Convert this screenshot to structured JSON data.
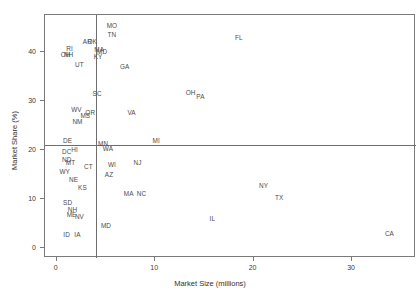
{
  "chart_data": {
    "type": "scatter",
    "title": "",
    "xlabel": "Market Size (millions)",
    "ylabel": "Market Share (%)",
    "xlim": [
      -1.2,
      36.5
    ],
    "ylim": [
      -2.0,
      47.5
    ],
    "xticks": [
      0,
      10,
      20,
      30
    ],
    "yticks": [
      0,
      10,
      20,
      30,
      40
    ],
    "grid": false,
    "legend": null,
    "point_style": "text-label-only",
    "reference_lines": [
      {
        "orientation": "vertical",
        "x": 4.0
      },
      {
        "orientation": "horizontal",
        "y": 21.0
      }
    ],
    "points": [
      {
        "label": "MO",
        "x": 5.6,
        "y": 45.3
      },
      {
        "label": "TN",
        "x": 5.6,
        "y": 43.4
      },
      {
        "label": "AR",
        "x": 3.1,
        "y": 42.1
      },
      {
        "label": "OK",
        "x": 3.6,
        "y": 42.1
      },
      {
        "label": "RI",
        "x": 1.3,
        "y": 40.6
      },
      {
        "label": "MA",
        "x": 4.3,
        "y": 40.4
      },
      {
        "label": "MD",
        "x": 4.6,
        "y": 40.0
      },
      {
        "label": "OH",
        "x": 0.9,
        "y": 39.4
      },
      {
        "label": "NH",
        "x": 1.2,
        "y": 39.4
      },
      {
        "label": "KY",
        "x": 4.2,
        "y": 39.0
      },
      {
        "label": "UT",
        "x": 2.3,
        "y": 37.3
      },
      {
        "label": "GA",
        "x": 6.9,
        "y": 37.0
      },
      {
        "label": "FL",
        "x": 18.5,
        "y": 42.8
      },
      {
        "label": "OH2",
        "x": 13.6,
        "y": 31.6
      },
      {
        "label": "PA",
        "x": 14.6,
        "y": 30.8
      },
      {
        "label": "SC",
        "x": 4.1,
        "y": 31.4
      },
      {
        "label": "WV",
        "x": 2.0,
        "y": 28.1
      },
      {
        "label": "OR",
        "x": 3.4,
        "y": 27.6
      },
      {
        "label": "MS",
        "x": 2.9,
        "y": 27.0
      },
      {
        "label": "VA",
        "x": 7.6,
        "y": 27.6
      },
      {
        "label": "NM",
        "x": 2.1,
        "y": 25.8
      },
      {
        "label": "DE",
        "x": 1.1,
        "y": 21.9
      },
      {
        "label": "MI",
        "x": 10.1,
        "y": 21.9
      },
      {
        "label": "MN",
        "x": 4.7,
        "y": 21.3
      },
      {
        "label": "WA",
        "x": 5.2,
        "y": 20.3
      },
      {
        "label": "DC",
        "x": 1.0,
        "y": 19.6
      },
      {
        "label": "HI",
        "x": 1.8,
        "y": 20.0
      },
      {
        "label": "ND",
        "x": 1.0,
        "y": 18.0
      },
      {
        "label": "MT",
        "x": 1.4,
        "y": 17.4
      },
      {
        "label": "CT",
        "x": 3.2,
        "y": 16.6
      },
      {
        "label": "WI",
        "x": 5.6,
        "y": 17.0
      },
      {
        "label": "NJ",
        "x": 8.2,
        "y": 17.4
      },
      {
        "label": "WY",
        "x": 0.8,
        "y": 15.6
      },
      {
        "label": "AZ",
        "x": 5.3,
        "y": 15.0
      },
      {
        "label": "NE",
        "x": 1.7,
        "y": 13.8
      },
      {
        "label": "KS",
        "x": 2.6,
        "y": 12.3
      },
      {
        "label": "NY",
        "x": 21.0,
        "y": 12.7
      },
      {
        "label": "MA2",
        "x": 7.3,
        "y": 11.0
      },
      {
        "label": "NC",
        "x": 8.6,
        "y": 11.0
      },
      {
        "label": "TX",
        "x": 22.6,
        "y": 10.2
      },
      {
        "label": "SD",
        "x": 1.1,
        "y": 9.2
      },
      {
        "label": "NH2",
        "x": 1.6,
        "y": 7.8
      },
      {
        "label": "ME",
        "x": 1.5,
        "y": 6.8
      },
      {
        "label": "NV",
        "x": 2.3,
        "y": 6.4
      },
      {
        "label": "IL",
        "x": 15.8,
        "y": 6.0
      },
      {
        "label": "MD2",
        "x": 5.0,
        "y": 4.6
      },
      {
        "label": "ID",
        "x": 1.0,
        "y": 2.6
      },
      {
        "label": "IA",
        "x": 2.1,
        "y": 2.6
      },
      {
        "label": "CA",
        "x": 33.8,
        "y": 2.8
      }
    ]
  },
  "axes": {
    "x_title": "Market Size (millions)",
    "y_title": "Market Share (%)",
    "x_tick_labels": [
      "0",
      "10",
      "20",
      "30"
    ],
    "y_tick_labels": [
      "0",
      "10",
      "20",
      "30",
      "40"
    ]
  },
  "colors": {
    "frame": "#7a7a7a",
    "label": "#4a4a4a",
    "reference_line": "#6e6e6e",
    "background": "#ffffff"
  }
}
